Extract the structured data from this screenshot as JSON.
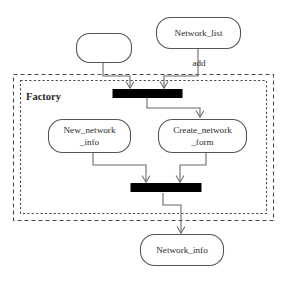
{
  "diagram": {
    "partition": {
      "label": "Factory",
      "style": "dashed-double-rectangle"
    },
    "colors": {
      "node_stroke": "#555555",
      "node_fill": "#ffffff",
      "edge_stroke": "#6a6a6a",
      "bar_fill": "#000000",
      "frame_stroke": "#4a4a4a",
      "text": "#2b2b2b",
      "background": "#ffffff"
    },
    "nodes": [
      {
        "id": "anon",
        "label": "",
        "line1": "",
        "line2": "",
        "shape": "rounded-rect",
        "inside_partition": false
      },
      {
        "id": "network_list",
        "label": "Network_list",
        "line1": "Network_list",
        "line2": "",
        "shape": "rounded-rect",
        "inside_partition": false
      },
      {
        "id": "new_network_info",
        "label": "New_network _info",
        "line1": "New_network",
        "line2": "_info",
        "shape": "rounded-rect",
        "inside_partition": true
      },
      {
        "id": "create_network_form",
        "label": "Create_network _form",
        "line1": "Create_network",
        "line2": "_form",
        "shape": "rounded-rect",
        "inside_partition": true
      },
      {
        "id": "network_info",
        "label": "Network_info",
        "line1": "Network_info",
        "line2": "",
        "shape": "rounded-rect",
        "inside_partition": false
      }
    ],
    "bars": [
      {
        "id": "bar_top",
        "kind": "synchronization-bar",
        "inputs": 2,
        "outputs": 1
      },
      {
        "id": "bar_bottom",
        "kind": "synchronization-bar",
        "inputs": 2,
        "outputs": 1
      }
    ],
    "edges": [
      {
        "id": "e1",
        "from": "anon",
        "to": "bar_top",
        "label": "",
        "arrow": true
      },
      {
        "id": "e2",
        "from": "network_list",
        "to": "bar_top",
        "label": "add",
        "arrow": true
      },
      {
        "id": "e3",
        "from": "bar_top",
        "to": "create_network_form",
        "label": "",
        "arrow": true
      },
      {
        "id": "e4",
        "from": "new_network_info",
        "to": "bar_bottom",
        "label": "",
        "arrow": true
      },
      {
        "id": "e5",
        "from": "create_network_form",
        "to": "bar_bottom",
        "label": "",
        "arrow": true
      },
      {
        "id": "e6",
        "from": "bar_bottom",
        "to": "network_info",
        "label": "",
        "arrow": true
      }
    ],
    "edge_labels": {
      "add": "add"
    }
  }
}
